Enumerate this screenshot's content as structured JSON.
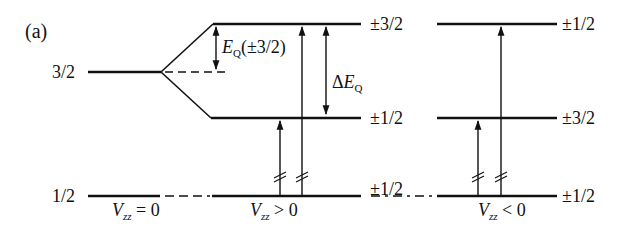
{
  "panel_label": "(a)",
  "left_levels": {
    "upper": "3/2",
    "lower": "1/2"
  },
  "conditions": {
    "zero": {
      "V": "V",
      "sub": "zz",
      "rel": " = 0"
    },
    "positive": {
      "V": "V",
      "sub": "zz",
      "rel": " > 0"
    },
    "negative": {
      "V": "V",
      "sub": "zz",
      "rel": " < 0"
    }
  },
  "vzz_pos_levels": {
    "top": "±3/2",
    "middle": "±1/2",
    "bottom": "±1/2"
  },
  "vzz_neg_levels": {
    "top": "±1/2",
    "middle": "±3/2",
    "bottom": "±1/2"
  },
  "annotations": {
    "eq_E": "E",
    "eq_sub": "Q",
    "eq_arg": "(±3/2)",
    "delta": "Δ",
    "delta_E": "E",
    "delta_sub": "Q"
  },
  "colors": {
    "line": "#111111",
    "background": "#ffffff"
  }
}
